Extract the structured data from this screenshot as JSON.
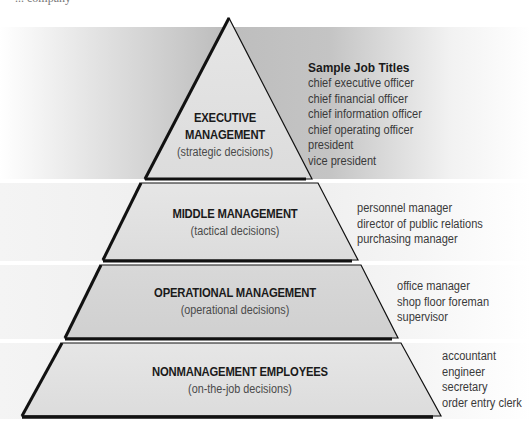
{
  "diagram": {
    "type": "pyramid",
    "cropped_caption": "... company",
    "sample_heading": "Sample Job Titles",
    "tiers": [
      {
        "title_line1": "EXECUTIVE",
        "title_line2": "MANAGEMENT",
        "subtitle": "(strategic decisions)",
        "job_titles": [
          "chief executive officer",
          "chief financial officer",
          "chief information officer",
          "chief operating officer",
          "president",
          "vice president"
        ]
      },
      {
        "title": "MIDDLE MANAGEMENT",
        "subtitle": "(tactical decisions)",
        "job_titles": [
          "personnel manager",
          "director of public relations",
          "purchasing manager"
        ]
      },
      {
        "title": "OPERATIONAL MANAGEMENT",
        "subtitle": "(operational decisions)",
        "job_titles": [
          "office manager",
          "shop floor foreman",
          "supervisor"
        ]
      },
      {
        "title": "NONMANAGEMENT EMPLOYEES",
        "subtitle": "(on-the-job decisions)",
        "job_titles": [
          "accountant",
          "engineer",
          "secretary",
          "order entry clerk"
        ]
      }
    ],
    "colors": {
      "tier_fill_light": "#e2e2e2",
      "tier_fill_mid": "#d4d4d4",
      "outline": "#111111",
      "band_gray": "#b9b9b9"
    }
  }
}
